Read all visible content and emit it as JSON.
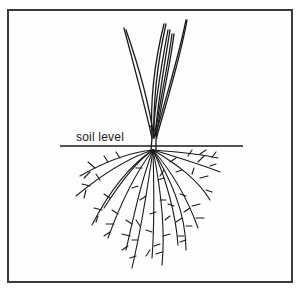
{
  "diagram": {
    "labels": {
      "soil_level": "soil level"
    },
    "colors": {
      "ink": "#1a1a1a",
      "frame": "#3a3a3a",
      "background": "#ffffff"
    }
  }
}
